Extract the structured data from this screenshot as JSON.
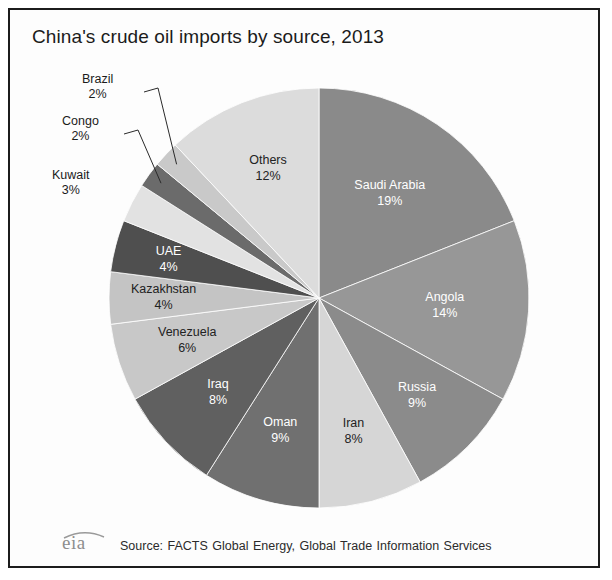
{
  "figure": {
    "title": "China's crude oil imports by source, 2013",
    "border_color": "#1c1c1c",
    "background": "#fdfdfd"
  },
  "footer": {
    "logo_text": "eia",
    "source": "Source: FACTS Global Energy, Global Trade Information Services"
  },
  "chart_data": {
    "type": "pie",
    "title": "China's crude oil imports by source, 2013",
    "unit": "%",
    "start_angle_deg": 0,
    "direction": "clockwise",
    "legend": "none",
    "labels_inside": true,
    "categories": [
      "Saudi Arabia",
      "Angola",
      "Russia",
      "Iran",
      "Oman",
      "Iraq",
      "Venezuela",
      "Kazakhstan",
      "UAE",
      "Kuwait",
      "Congo",
      "Brazil",
      "Others"
    ],
    "values": [
      19,
      14,
      9,
      8,
      9,
      8,
      6,
      4,
      4,
      3,
      2,
      2,
      12
    ],
    "slices": [
      {
        "name": "Saudi Arabia",
        "value": 19,
        "label": "Saudi Arabia",
        "percent": "19%",
        "color": "#8a8a8a",
        "text_color": "light",
        "placement": "inside"
      },
      {
        "name": "Angola",
        "value": 14,
        "label": "Angola",
        "percent": "14%",
        "color": "#979797",
        "text_color": "light",
        "placement": "inside"
      },
      {
        "name": "Russia",
        "value": 9,
        "label": "Russia",
        "percent": "9%",
        "color": "#8b8b8b",
        "text_color": "light",
        "placement": "inside"
      },
      {
        "name": "Iran",
        "value": 8,
        "label": "Iran",
        "percent": "8%",
        "color": "#d6d6d6",
        "text_color": "dark",
        "placement": "inside"
      },
      {
        "name": "Oman",
        "value": 9,
        "label": "Oman",
        "percent": "9%",
        "color": "#707070",
        "text_color": "light",
        "placement": "inside"
      },
      {
        "name": "Iraq",
        "value": 8,
        "label": "Iraq",
        "percent": "8%",
        "color": "#606060",
        "text_color": "light",
        "placement": "inside"
      },
      {
        "name": "Venezuela",
        "value": 6,
        "label": "Venezuela",
        "percent": "6%",
        "color": "#c8c8c8",
        "text_color": "dark",
        "placement": "inside"
      },
      {
        "name": "Kazakhstan",
        "value": 4,
        "label": "Kazakhstan",
        "percent": "4%",
        "color": "#c4c4c4",
        "text_color": "dark",
        "placement": "inside"
      },
      {
        "name": "UAE",
        "value": 4,
        "label": "UAE",
        "percent": "4%",
        "color": "#4f4f4f",
        "text_color": "light",
        "placement": "inside"
      },
      {
        "name": "Kuwait",
        "value": 3,
        "label": "Kuwait",
        "percent": "3%",
        "color": "#e2e2e2",
        "text_color": "dark",
        "placement": "outside"
      },
      {
        "name": "Congo",
        "value": 2,
        "label": "Congo",
        "percent": "2%",
        "color": "#6b6b6b",
        "text_color": "dark",
        "placement": "outside"
      },
      {
        "name": "Brazil",
        "value": 2,
        "label": "Brazil",
        "percent": "2%",
        "color": "#c9c9c9",
        "text_color": "dark",
        "placement": "outside"
      },
      {
        "name": "Others",
        "value": 12,
        "label": "Others",
        "percent": "12%",
        "color": "#dcdcdc",
        "text_color": "dark",
        "placement": "inside"
      }
    ],
    "outside_labels": [
      {
        "name": "Brazil",
        "label": "Brazil",
        "percent": "2%",
        "x": 72,
        "y": 62
      },
      {
        "name": "Congo",
        "label": "Congo",
        "percent": "2%",
        "x": 52,
        "y": 104
      },
      {
        "name": "Kuwait",
        "label": "Kuwait",
        "percent": "3%",
        "x": 42,
        "y": 158
      }
    ]
  }
}
